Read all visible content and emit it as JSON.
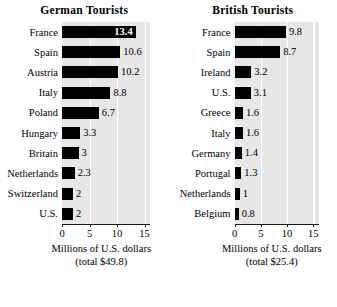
{
  "chart_data": [
    {
      "type": "bar",
      "orientation": "horizontal",
      "title": "German Tourists",
      "categories": [
        "France",
        "Spain",
        "Austria",
        "Italy",
        "Poland",
        "Hungary",
        "Britain",
        "Netherlands",
        "Switzerland",
        "U.S."
      ],
      "values": [
        13.4,
        10.6,
        10.2,
        8.8,
        6.7,
        3.3,
        3,
        2.3,
        2,
        2
      ],
      "value_labels": [
        "13.4",
        "10.6",
        "10.2",
        "8.8",
        "6.7",
        "3.3",
        "3",
        "2.3",
        "2",
        "2"
      ],
      "label_placement": [
        "inside",
        "outside",
        "outside",
        "outside",
        "outside",
        "outside",
        "outside",
        "outside",
        "outside",
        "outside"
      ],
      "xlabel": "Millions of  U.S. dollars",
      "xlabel_line2": "(total $49.8)",
      "ylabel": "",
      "xlim": [
        0,
        16
      ],
      "xticks": [
        0,
        5,
        10,
        15
      ],
      "xtick_labels": [
        "0",
        "5",
        "10",
        "15"
      ],
      "grid": true,
      "grid_axis": "x",
      "legend": "none",
      "bar_color": "#000000",
      "plot_background": "#e7e7e7",
      "gridline_color": "#ffffff"
    },
    {
      "type": "bar",
      "orientation": "horizontal",
      "title": "British Tourists",
      "categories": [
        "France",
        "Spain",
        "Ireland",
        "U.S.",
        "Greece",
        "Italy",
        "Germany",
        "Portugal",
        "Netherlands",
        "Belgium"
      ],
      "values": [
        9.8,
        8.7,
        3.2,
        3.1,
        1.6,
        1.6,
        1.4,
        1.3,
        1,
        0.8
      ],
      "value_labels": [
        "9.8",
        "8.7",
        "3.2",
        "3.1",
        "1.6",
        "1.6",
        "1.4",
        "1.3",
        "1",
        "0.8"
      ],
      "label_placement": [
        "outside",
        "outside",
        "outside",
        "outside",
        "outside",
        "outside",
        "outside",
        "outside",
        "outside",
        "outside"
      ],
      "xlabel": "Millions of U.S. dollars",
      "xlabel_line2": "(total $25.4)",
      "ylabel": "",
      "xlim": [
        0,
        16
      ],
      "xticks": [
        0,
        5,
        10,
        15
      ],
      "xtick_labels": [
        "0",
        "5",
        "10",
        "15"
      ],
      "grid": true,
      "grid_axis": "x",
      "legend": "none",
      "bar_color": "#000000",
      "plot_background": "#e7e7e7",
      "gridline_color": "#ffffff"
    }
  ]
}
